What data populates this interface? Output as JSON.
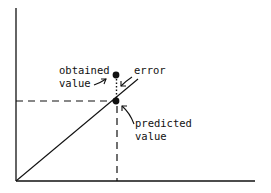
{
  "diagram": {
    "type": "regression-error-illustration",
    "labels": {
      "obtained_line1": "obtained",
      "obtained_line2": "value",
      "error": "error",
      "predicted_line1": "predicted",
      "predicted_line2": "value"
    },
    "colors": {
      "ink": "#111111",
      "background": "#ffffff"
    }
  }
}
